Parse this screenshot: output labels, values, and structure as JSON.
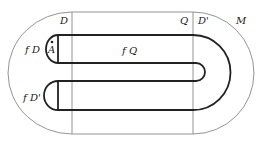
{
  "diagram": {
    "labels": {
      "D": "D",
      "Q": "Q",
      "D_prime": "D'",
      "M": "M",
      "fD": "f D",
      "fD_prime": "f D'",
      "fQ": "f Q",
      "A": "A"
    },
    "colors": {
      "thin_line": "#888888",
      "thick_line": "#222222",
      "text": "#222222",
      "background": "#ffffff"
    }
  }
}
